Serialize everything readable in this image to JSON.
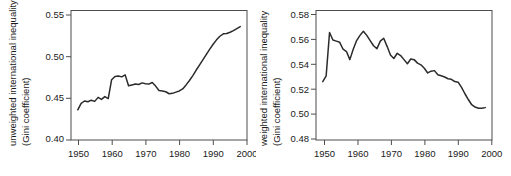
{
  "figure": {
    "background": "#ffffff",
    "line_color": "#2b2b2b",
    "axis_color": "#4d4d4d"
  },
  "chart_data": [
    {
      "type": "line",
      "panel": "left",
      "title": "",
      "xlabel": "",
      "ylabel": "unweighted international inequality (Gini coefficient)",
      "ylabel_line1": "unweighted international inequality",
      "ylabel_line2": "(Gini coefficient)",
      "xlim": [
        1948,
        2000
      ],
      "ylim": [
        0.395,
        0.556
      ],
      "xticks": [
        1950,
        1960,
        1970,
        1980,
        1990,
        2000
      ],
      "xticklabels": [
        "1950",
        "1960",
        "1970",
        "1980",
        "1990",
        "2000"
      ],
      "yticks": [
        0.4,
        0.45,
        0.5,
        0.55
      ],
      "yticklabels": [
        "0.40",
        "0.45",
        "0.50",
        "0.55"
      ],
      "grid": false,
      "legend": "none",
      "x": [
        1950,
        1951,
        1952,
        1953,
        1954,
        1955,
        1956,
        1957,
        1958,
        1959,
        1960,
        1961,
        1962,
        1963,
        1964,
        1965,
        1966,
        1967,
        1968,
        1969,
        1970,
        1971,
        1972,
        1973,
        1974,
        1975,
        1976,
        1977,
        1978,
        1979,
        1980,
        1981,
        1982,
        1983,
        1984,
        1985,
        1986,
        1987,
        1988,
        1989,
        1990,
        1991,
        1992,
        1993,
        1994,
        1995,
        1996,
        1997,
        1998
      ],
      "values": [
        0.4325,
        0.4405,
        0.4435,
        0.4425,
        0.4445,
        0.443,
        0.448,
        0.4455,
        0.449,
        0.4465,
        0.47,
        0.474,
        0.4745,
        0.4735,
        0.476,
        0.4625,
        0.4635,
        0.4645,
        0.464,
        0.466,
        0.465,
        0.4645,
        0.4665,
        0.462,
        0.4565,
        0.456,
        0.455,
        0.4525,
        0.453,
        0.4545,
        0.456,
        0.4585,
        0.4635,
        0.469,
        0.475,
        0.482,
        0.4885,
        0.495,
        0.5015,
        0.508,
        0.514,
        0.5195,
        0.524,
        0.527,
        0.5275,
        0.529,
        0.531,
        0.5335,
        0.536
      ]
    },
    {
      "type": "line",
      "panel": "right",
      "title": "",
      "xlabel": "",
      "ylabel": "weighted international inequality (Gini coefficient)",
      "ylabel_line1": "weighted international inequality",
      "ylabel_line2": "(Gini coefficient)",
      "xlim": [
        1948,
        2000
      ],
      "ylim": [
        0.4735,
        0.5855
      ],
      "xticks": [
        1950,
        1960,
        1970,
        1980,
        1990,
        2000
      ],
      "xticklabels": [
        "1950",
        "1960",
        "1970",
        "1980",
        "1990",
        "2000"
      ],
      "yticks": [
        0.48,
        0.5,
        0.52,
        0.54,
        0.56,
        0.58
      ],
      "yticklabels": [
        "0.48",
        "0.50",
        "0.52",
        "0.54",
        "0.56",
        "0.58"
      ],
      "grid": false,
      "legend": "none",
      "x": [
        1950,
        1951,
        1952,
        1953,
        1954,
        1955,
        1956,
        1957,
        1958,
        1959,
        1960,
        1961,
        1962,
        1963,
        1964,
        1965,
        1966,
        1967,
        1968,
        1969,
        1970,
        1971,
        1972,
        1973,
        1974,
        1975,
        1976,
        1977,
        1978,
        1979,
        1980,
        1981,
        1982,
        1983,
        1984,
        1985,
        1986,
        1987,
        1988,
        1989,
        1990,
        1991,
        1992,
        1993,
        1994,
        1995,
        1996,
        1997,
        1998
      ],
      "values": [
        0.524,
        0.529,
        0.5665,
        0.56,
        0.559,
        0.558,
        0.552,
        0.55,
        0.543,
        0.552,
        0.5595,
        0.564,
        0.5675,
        0.564,
        0.5595,
        0.555,
        0.5525,
        0.559,
        0.5615,
        0.5545,
        0.547,
        0.544,
        0.5485,
        0.5465,
        0.543,
        0.5395,
        0.5435,
        0.543,
        0.54,
        0.5385,
        0.5355,
        0.5315,
        0.533,
        0.5335,
        0.53,
        0.529,
        0.528,
        0.5265,
        0.526,
        0.524,
        0.5235,
        0.519,
        0.5135,
        0.5085,
        0.504,
        0.502,
        0.501,
        0.501,
        0.5015
      ]
    }
  ]
}
